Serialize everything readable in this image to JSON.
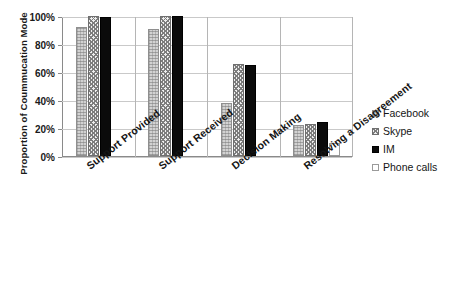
{
  "chart_data": {
    "type": "bar",
    "title": "",
    "xlabel": "",
    "ylabel": "Proportion of Coummucation Mode",
    "ylim": [
      0,
      100
    ],
    "ytick_labels": [
      "0%",
      "20%",
      "40%",
      "60%",
      "80%",
      "100%"
    ],
    "ytick_values": [
      0,
      20,
      40,
      60,
      80,
      100
    ],
    "grid": true,
    "legend_position": "right",
    "categories": [
      "Support Provided",
      "Support Received",
      "Decision Making",
      "Resolving a Disagreement"
    ],
    "series": [
      {
        "name": "Facebook",
        "swatch": "#d2d2d2",
        "pattern": "light-grey-speckle",
        "values": [
          92,
          91,
          38,
          22
        ]
      },
      {
        "name": "Skype",
        "swatch": "#efefef",
        "pattern": "checkerboard",
        "values": [
          100,
          100,
          66,
          23
        ]
      },
      {
        "name": "IM",
        "swatch": "#0b0b0b",
        "pattern": "solid-black",
        "values": [
          99,
          100,
          65,
          24
        ]
      },
      {
        "name": "Phone calls",
        "swatch": "#ffffff",
        "pattern": "white-empty",
        "values": [
          0,
          0,
          0,
          9
        ]
      }
    ]
  },
  "legend": {
    "items": [
      {
        "label": "Facebook"
      },
      {
        "label": "Skype"
      },
      {
        "label": "IM"
      },
      {
        "label": "Phone calls"
      }
    ]
  },
  "caption": {
    "text": ""
  }
}
